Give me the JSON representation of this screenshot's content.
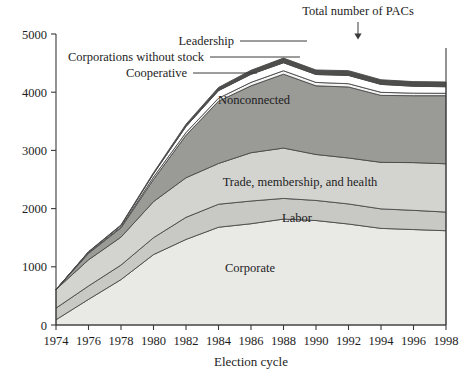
{
  "chart_data": {
    "type": "area",
    "stacked": true,
    "title": "",
    "xlabel": "Election cycle",
    "ylabel": "",
    "x": [
      1974,
      1976,
      1978,
      1980,
      1982,
      1984,
      1986,
      1988,
      1990,
      1992,
      1994,
      1996,
      1998
    ],
    "xticklabels": [
      "1974",
      "1976",
      "1978",
      "1980",
      "1982",
      "1984",
      "1986",
      "1988",
      "1990",
      "1992",
      "1994",
      "1996",
      "1998"
    ],
    "xlim": [
      1974,
      1998
    ],
    "ylim": [
      0,
      5000
    ],
    "yticks": [
      0,
      1000,
      2000,
      3000,
      4000,
      5000
    ],
    "yticklabels": [
      "0",
      "1000",
      "2000",
      "3000",
      "4000",
      "5000"
    ],
    "grid": false,
    "legend_position": "inline-labels",
    "series": [
      {
        "name": "Corporate",
        "color": "#e9e9e6",
        "values": [
          90,
          440,
          780,
          1210,
          1470,
          1680,
          1740,
          1820,
          1795,
          1735,
          1660,
          1640,
          1620
        ]
      },
      {
        "name": "Labor",
        "color": "#c8c8c5",
        "values": [
          200,
          230,
          250,
          290,
          380,
          395,
          390,
          355,
          345,
          345,
          335,
          330,
          320
        ]
      },
      {
        "name": "Trade, membership, and health",
        "color": "#d3d3d0",
        "values": [
          320,
          450,
          480,
          620,
          680,
          700,
          830,
          865,
          790,
          790,
          800,
          820,
          830
        ]
      },
      {
        "name": "Nonconnected",
        "color": "#9a9a97",
        "values": [
          0,
          110,
          160,
          380,
          730,
          1070,
          1150,
          1270,
          1180,
          1220,
          1150,
          1150,
          1170
        ]
      },
      {
        "name": "Cooperative",
        "color": "#f4f4f2",
        "values": [
          0,
          10,
          15,
          42,
          47,
          52,
          59,
          59,
          58,
          56,
          53,
          44,
          41
        ]
      },
      {
        "name": "Corporations without stock",
        "color": "#ffffff",
        "values": [
          0,
          15,
          25,
          56,
          103,
          130,
          138,
          137,
          136,
          142,
          136,
          118,
          113
        ]
      },
      {
        "name": "Leadership",
        "color": "#4e4e4c",
        "values": [
          0,
          5,
          10,
          20,
          40,
          55,
          70,
          80,
          78,
          82,
          80,
          80,
          82
        ]
      }
    ],
    "totals": [
      610,
      1260,
      1720,
      2618,
      3450,
      4082,
      4377,
      4586,
      4382,
      4370,
      4214,
      4182,
      4176
    ],
    "annotations": [
      {
        "text": "Total number of PACs",
        "target_x": 1991,
        "kind": "arrow-down"
      },
      {
        "text": "Leadership",
        "kind": "leader-line"
      },
      {
        "text": "Corporations without stock",
        "kind": "leader-line"
      },
      {
        "text": "Cooperative",
        "kind": "leader-line"
      }
    ]
  },
  "axes": {
    "x_title": "Election cycle",
    "y_ticks": [
      "5000",
      "4000",
      "3000",
      "2000",
      "1000",
      "0"
    ],
    "x_ticks": [
      "1974",
      "1976",
      "1978",
      "1980",
      "1982",
      "1984",
      "1986",
      "1988",
      "1990",
      "1992",
      "1994",
      "1996",
      "1998"
    ]
  },
  "labels": {
    "nonconnected": "Nonconnected",
    "trade": "Trade, membership, and health",
    "labor": "Labor",
    "corporate": "Corporate",
    "leadership": "Leadership",
    "corporations_without_stock": "Corporations without stock",
    "cooperative": "Cooperative",
    "total": "Total number of PACs"
  }
}
